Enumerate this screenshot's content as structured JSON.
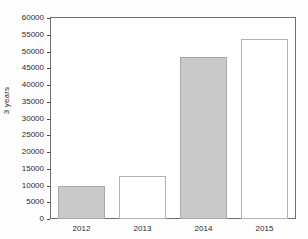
{
  "chart_data": {
    "type": "bar",
    "title": "",
    "xlabel": "",
    "ylabel": "3 years",
    "categories": [
      "2012",
      "2013",
      "2014",
      "2015"
    ],
    "values": [
      9900,
      12800,
      48500,
      53800
    ],
    "series": [
      {
        "name": "3 years",
        "values": [
          9900,
          12800,
          48500,
          53800
        ]
      }
    ],
    "bar_styles": [
      "filled",
      "hollow",
      "filled",
      "hollow"
    ],
    "ylim": [
      0,
      60000
    ],
    "ytick_step": 5000,
    "yticks": [
      "0",
      "5000",
      "10000",
      "15000",
      "20000",
      "25000",
      "30000",
      "35000",
      "40000",
      "45000",
      "50000",
      "55000",
      "60000"
    ],
    "ytick_values": [
      0,
      5000,
      10000,
      15000,
      20000,
      25000,
      30000,
      35000,
      40000,
      45000,
      50000,
      55000,
      60000
    ],
    "grid": false,
    "legend": null,
    "colors": {
      "bar_fill": "#c9c9c9",
      "bar_fill_stroke": "#a8a8a8",
      "bar_hollow": "#ffffff",
      "bar_hollow_stroke": "#b3b3b3",
      "axis": "#6f6f6f",
      "text": "#2b2b2b",
      "background": "#fdfdfd"
    }
  }
}
